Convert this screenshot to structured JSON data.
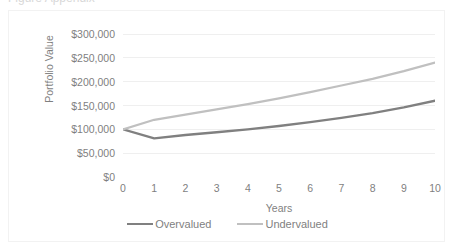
{
  "top_sliver": {
    "text": "Figure Appendix"
  },
  "chart_data": {
    "type": "line",
    "title": "",
    "subtitle": "",
    "xlabel": "Years",
    "ylabel": "Portfolio Value",
    "x": [
      0,
      1,
      2,
      3,
      4,
      5,
      6,
      7,
      8,
      9,
      10
    ],
    "xtick_labels": [
      "0",
      "1",
      "2",
      "3",
      "4",
      "5",
      "6",
      "7",
      "8",
      "9",
      "10"
    ],
    "ytick_labels": [
      "$0",
      "$50,000",
      "$100,000",
      "$150,000",
      "$200,000",
      "$250,000",
      "$300,000"
    ],
    "ytick_values": [
      0,
      50000,
      100000,
      150000,
      200000,
      250000,
      300000
    ],
    "xlim": [
      0,
      10
    ],
    "ylim": [
      0,
      300000
    ],
    "grid": "horizontal",
    "legend_position": "bottom",
    "series": [
      {
        "name": "Overvalued",
        "color": "#808080",
        "line_width": 2.4,
        "values": [
          100000,
          81000,
          88000,
          94000,
          100000,
          107000,
          115000,
          124000,
          134000,
          146000,
          160000
        ]
      },
      {
        "name": "Undervalued",
        "color": "#c0c0c0",
        "line_width": 2.2,
        "values": [
          100000,
          120000,
          131000,
          142000,
          153000,
          165000,
          178000,
          192000,
          206000,
          222000,
          240000
        ]
      }
    ]
  }
}
